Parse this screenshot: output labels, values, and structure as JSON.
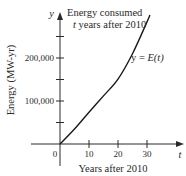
{
  "chart_data": {
    "type": "line",
    "title": "Energy consumed",
    "subtitle": "t years after 2010",
    "xlabel": "Years after 2010",
    "ylabel": "Energy (MW-yr)",
    "x_axis_var": "t",
    "y_axis_var": "y",
    "curve_label": "y = E(t)",
    "x": [
      0,
      5,
      10,
      15,
      20,
      25,
      30,
      31
    ],
    "series": [
      {
        "name": "y = E(t)",
        "values": [
          0,
          35000,
          74000,
          112000,
          151000,
          210000,
          284000,
          300000
        ]
      }
    ],
    "xticks": [
      10,
      20,
      30
    ],
    "xtick_labels": [
      "10",
      "20",
      "30"
    ],
    "yticks": [
      50000,
      100000,
      150000,
      200000,
      250000
    ],
    "ytick_labels": [
      "",
      "100,000",
      "",
      "200,000",
      ""
    ],
    "origin_label": "0",
    "xlim": [
      -10,
      42
    ],
    "ylim": [
      -50000,
      305000
    ],
    "grid": false,
    "legend": "none",
    "line_color": "#1a1a1a",
    "axis_color": "#2a2a2a"
  }
}
